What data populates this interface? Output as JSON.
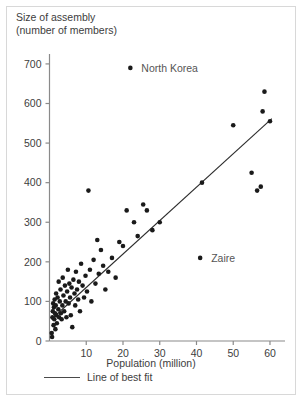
{
  "figure": {
    "title_line1": "Size of assembly",
    "title_line2": "(number of members)",
    "xaxis_caption": "Population (million)",
    "legend_label": "Line of best fit"
  },
  "chart_data": {
    "type": "scatter",
    "title": "Size of assembly (number of members)",
    "xlabel": "Population (million)",
    "ylabel": "Size of assembly (number of members)",
    "xlim": [
      0,
      63
    ],
    "ylim": [
      0,
      720
    ],
    "xticks": [
      10,
      20,
      30,
      40,
      50,
      60
    ],
    "yticks": [
      0,
      100,
      200,
      300,
      400,
      500,
      600,
      700
    ],
    "grid": false,
    "legend_position": "below-axis",
    "series": [
      {
        "name": "Countries",
        "marker": "filled-circle",
        "color": "#1a1a1a",
        "points": [
          [
            0.6,
            20
          ],
          [
            0.7,
            10
          ],
          [
            0.8,
            60
          ],
          [
            0.9,
            75
          ],
          [
            1.0,
            95
          ],
          [
            1.1,
            40
          ],
          [
            1.2,
            85
          ],
          [
            1.3,
            55
          ],
          [
            1.4,
            105
          ],
          [
            1.5,
            70
          ],
          [
            1.6,
            30
          ],
          [
            1.7,
            90
          ],
          [
            1.8,
            120
          ],
          [
            1.9,
            65
          ],
          [
            2.0,
            45
          ],
          [
            2.2,
            110
          ],
          [
            2.4,
            80
          ],
          [
            2.5,
            150
          ],
          [
            2.6,
            60
          ],
          [
            2.8,
            100
          ],
          [
            3.0,
            130
          ],
          [
            3.1,
            70
          ],
          [
            3.3,
            55
          ],
          [
            3.5,
            90
          ],
          [
            3.6,
            160
          ],
          [
            3.8,
            115
          ],
          [
            4.0,
            75
          ],
          [
            4.2,
            140
          ],
          [
            4.4,
            100
          ],
          [
            4.6,
            60
          ],
          [
            4.8,
            125
          ],
          [
            5.0,
            180
          ],
          [
            5.2,
            95
          ],
          [
            5.4,
            145
          ],
          [
            5.6,
            110
          ],
          [
            5.8,
            65
          ],
          [
            6.0,
            135
          ],
          [
            6.2,
            35
          ],
          [
            6.5,
            155
          ],
          [
            6.8,
            120
          ],
          [
            7.0,
            90
          ],
          [
            7.2,
            175
          ],
          [
            7.5,
            130
          ],
          [
            7.8,
            105
          ],
          [
            8.0,
            150
          ],
          [
            8.3,
            75
          ],
          [
            8.6,
            195
          ],
          [
            9.0,
            140
          ],
          [
            9.4,
            110
          ],
          [
            9.8,
            165
          ],
          [
            10.2,
            125
          ],
          [
            10.6,
            380
          ],
          [
            11.0,
            180
          ],
          [
            11.4,
            100
          ],
          [
            12.0,
            205
          ],
          [
            12.5,
            145
          ],
          [
            13.0,
            255
          ],
          [
            13.4,
            170
          ],
          [
            14.0,
            230
          ],
          [
            14.6,
            190
          ],
          [
            15.2,
            130
          ],
          [
            16.0,
            175
          ],
          [
            17.0,
            210
          ],
          [
            18.0,
            160
          ],
          [
            19.0,
            250
          ],
          [
            20.0,
            240
          ],
          [
            21.0,
            330
          ],
          [
            22.0,
            690
          ],
          [
            23.0,
            300
          ],
          [
            24.0,
            265
          ],
          [
            25.5,
            345
          ],
          [
            26.5,
            330
          ],
          [
            28.0,
            280
          ],
          [
            30.0,
            300
          ],
          [
            41.0,
            210
          ],
          [
            41.5,
            400
          ],
          [
            50.0,
            545
          ],
          [
            55.0,
            425
          ],
          [
            56.5,
            380
          ],
          [
            57.5,
            390
          ],
          [
            58.0,
            580
          ],
          [
            58.5,
            630
          ],
          [
            60.0,
            555
          ]
        ]
      }
    ],
    "annotations": [
      {
        "label": "North Korea",
        "x": 22,
        "y": 690
      },
      {
        "label": "Zaire",
        "x": 41,
        "y": 210
      }
    ],
    "fit_line": {
      "label": "Line of best fit",
      "x_start": 0.5,
      "y_start": 55,
      "x_end": 60.5,
      "y_end": 562
    }
  }
}
